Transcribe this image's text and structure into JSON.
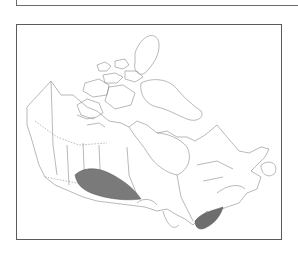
{
  "figure": {
    "type": "distribution-map",
    "region": "Canada",
    "outline_color": "#8a8a8a",
    "frame_color": "#5a5a5a",
    "range_fill_color": "#7a7a7a",
    "ranges": [
      {
        "name": "prairies-range",
        "description": "Southern Alberta, Saskatchewan and Manitoba"
      },
      {
        "name": "southern-ontario-range",
        "description": "Southern Ontario peninsula"
      }
    ]
  }
}
